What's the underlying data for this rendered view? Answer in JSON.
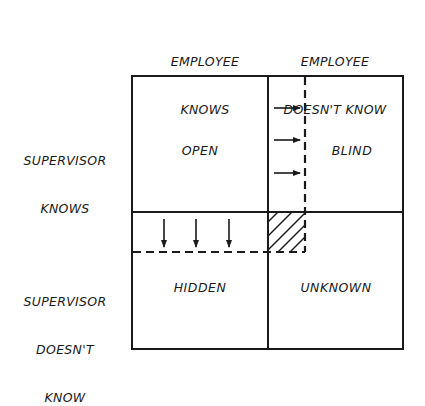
{
  "column_headers": [
    {
      "line1": "EMPLOYEE",
      "line2": "KNOWS"
    },
    {
      "line1": "EMPLOYEE",
      "line2": "DOESN'T KNOW"
    }
  ],
  "row_headers": [
    {
      "line1": "SUPERVISOR",
      "line2": "KNOWS",
      "line3": ""
    },
    {
      "line1": "SUPERVISOR",
      "line2": "DOESN'T",
      "line3": "KNOW"
    }
  ],
  "quadrants": {
    "open": "OPEN",
    "blind": "BLIND",
    "hidden": "HIDDEN",
    "unknown": "UNKNOWN"
  },
  "annotations": {
    "right_arrows_count": 3,
    "down_arrows_count": 3,
    "hatched_overlap": true
  },
  "colors": {
    "line": "#1a1a1a",
    "background": "#ffffff"
  }
}
